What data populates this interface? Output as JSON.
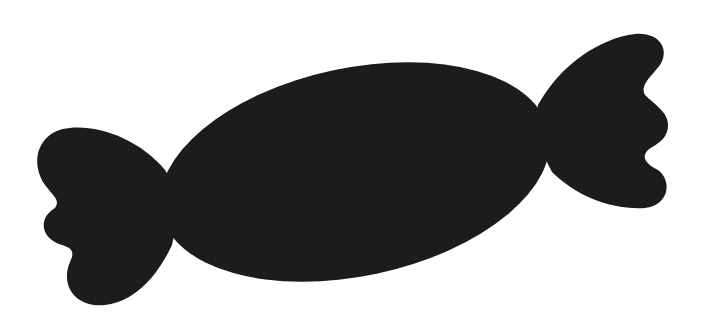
{
  "image": {
    "subject": "wrapped candy silhouette",
    "background_color": "#ffffff",
    "fill_color": "#1c1c1c"
  }
}
